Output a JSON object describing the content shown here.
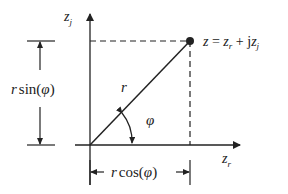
{
  "diagram": {
    "axes": {
      "x_label": "z",
      "x_label_sub": "r",
      "y_label": "z",
      "y_label_sub": "j"
    },
    "point": {
      "label_lhs": "z",
      "label_eq": " = ",
      "label_zr": "z",
      "label_zr_sub": "r",
      "label_plus": " + j",
      "label_zj": "z",
      "label_zj_sub": "j"
    },
    "radius_label": "r",
    "angle_label": "φ",
    "vertical_dimension": {
      "r": "r",
      "fn": "sin",
      "open": "(",
      "arg": "φ",
      "close": ")"
    },
    "horizontal_dimension": {
      "r": "r",
      "fn": "cos",
      "open": "(",
      "arg": "φ",
      "close": ")"
    },
    "colors": {
      "stroke": "#222222",
      "background": "#ffffff"
    }
  }
}
